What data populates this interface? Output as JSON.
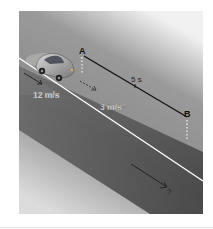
{
  "diagram": {
    "point_a_label": "A",
    "point_b_label": "B",
    "time_label": "5 s",
    "initial_speed_label": "12 m/s",
    "acceleration_label": "3 m/s",
    "acceleration_exponent": "2",
    "unknown_label": "?"
  },
  "colors": {
    "panel_top": "#8a8a8a",
    "panel_bottom": "#d8d8d8",
    "road": "#4a4a4a",
    "edge_line": "#ffffff",
    "label_dark": "#111111",
    "label_light": "#f2f2f2"
  }
}
